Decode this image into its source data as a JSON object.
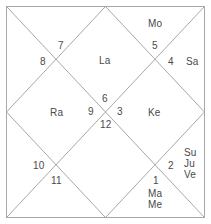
{
  "chart": {
    "style": "north-indian-vedic-rasi-chart",
    "title": "",
    "background_color": "#ffffff",
    "line_color": "#a8a8a8",
    "text_color": "#4a4a4a",
    "houses": [
      {
        "number": "1",
        "planets": [
          "Ma",
          "Me"
        ]
      },
      {
        "number": "2",
        "planets": [
          "Su",
          "Ju",
          "Ve"
        ]
      },
      {
        "number": "3",
        "planets": [
          "Ke"
        ]
      },
      {
        "number": "4",
        "planets": [
          "Sa"
        ]
      },
      {
        "number": "5",
        "planets": [
          "Mo"
        ]
      },
      {
        "number": "6",
        "planets": []
      },
      {
        "number": "7",
        "planets": []
      },
      {
        "number": "8",
        "planets": []
      },
      {
        "number": "9",
        "planets": [
          "Ra"
        ]
      },
      {
        "number": "10",
        "planets": []
      },
      {
        "number": "11",
        "planets": []
      },
      {
        "number": "12",
        "planets": [
          "La"
        ]
      }
    ],
    "house_numbers": {
      "h1": "1",
      "h2": "2",
      "h3": "3",
      "h4": "4",
      "h5": "5",
      "h6": "6",
      "h7": "7",
      "h8": "8",
      "h9": "9",
      "h10": "10",
      "h11": "11",
      "h12": "12"
    },
    "planet_labels": {
      "lagna": "La",
      "moon": "Mo",
      "saturn": "Sa",
      "ketu": "Ke",
      "rahu": "Ra",
      "sun": "Su",
      "jupiter": "Ju",
      "venus": "Ve",
      "mars": "Ma",
      "mercury": "Me"
    }
  }
}
